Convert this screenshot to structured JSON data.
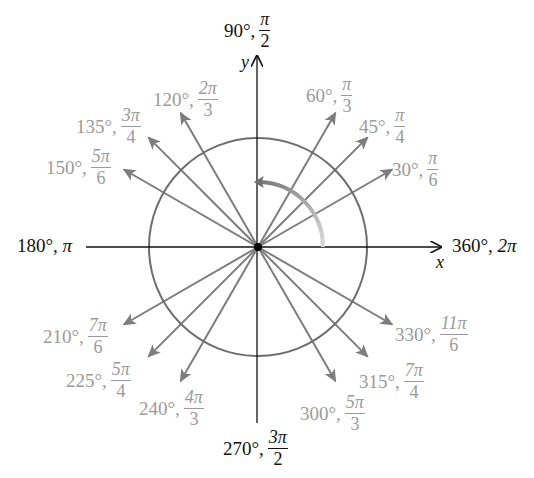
{
  "diagram": {
    "center": {
      "x": 258,
      "y": 247
    },
    "circle_radius": 109,
    "arrow_length": 155,
    "colors": {
      "axis": "#111111",
      "circle": "#6e6e6e",
      "arrow": "#7d7d7d",
      "angle_label": "#9a9a9a",
      "axis_label": "#111111"
    },
    "axes": {
      "x_label": "x",
      "y_label": "y"
    },
    "axis_labels": [
      {
        "deg": "90°",
        "rad_num": "π",
        "rad_den": "2",
        "position": "top"
      },
      {
        "deg": "180°",
        "rad": "π",
        "position": "left"
      },
      {
        "deg": "270°",
        "rad_num": "3π",
        "rad_den": "2",
        "position": "bottom"
      },
      {
        "deg": "360°",
        "rad": "2π",
        "position": "right"
      }
    ],
    "angles": [
      {
        "deg_value": 30,
        "deg": "30°",
        "rad_num": "π",
        "rad_den": "6"
      },
      {
        "deg_value": 45,
        "deg": "45°",
        "rad_num": "π",
        "rad_den": "4"
      },
      {
        "deg_value": 60,
        "deg": "60°",
        "rad_num": "π",
        "rad_den": "3"
      },
      {
        "deg_value": 120,
        "deg": "120°",
        "rad_num": "2π",
        "rad_den": "3"
      },
      {
        "deg_value": 135,
        "deg": "135°",
        "rad_num": "3π",
        "rad_den": "4"
      },
      {
        "deg_value": 150,
        "deg": "150°",
        "rad_num": "5π",
        "rad_den": "6"
      },
      {
        "deg_value": 210,
        "deg": "210°",
        "rad_num": "7π",
        "rad_den": "6"
      },
      {
        "deg_value": 225,
        "deg": "225°",
        "rad_num": "5π",
        "rad_den": "4"
      },
      {
        "deg_value": 240,
        "deg": "240°",
        "rad_num": "4π",
        "rad_den": "3"
      },
      {
        "deg_value": 300,
        "deg": "300°",
        "rad_num": "5π",
        "rad_den": "3"
      },
      {
        "deg_value": 315,
        "deg": "315°",
        "rad_num": "7π",
        "rad_den": "4"
      },
      {
        "deg_value": 330,
        "deg": "330°",
        "rad_num": "11π",
        "rad_den": "6"
      }
    ],
    "rotation_arrow": {
      "from_deg": 0,
      "to_deg": 92,
      "radius": 65
    }
  }
}
